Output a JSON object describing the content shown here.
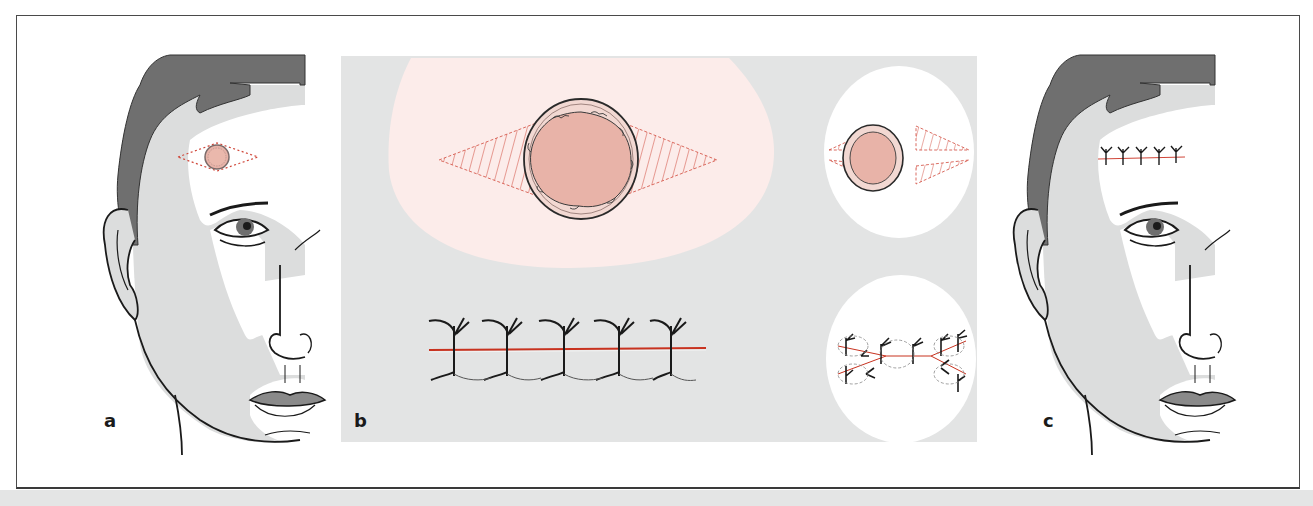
{
  "figure": {
    "panels": [
      {
        "id": "a",
        "label": "a",
        "description": "Face profile with circular lesion on forehead and dashed elliptical excision outline"
      },
      {
        "id": "b",
        "label": "b",
        "description": "Magnified views: elliptical excision around lesion with hatched wedges; sutured closure with interrupted sutures"
      },
      {
        "id": "c",
        "label": "c",
        "description": "Face profile with sutured linear closure on forehead"
      }
    ],
    "colors": {
      "hair": "#6f6f6f",
      "skin_shade": "#dcdddd",
      "skin_light": "#ffffff",
      "outline": "#1a1a1a",
      "lesion_fill": "#e8b3a8",
      "lesion_rim": "#f2d8d2",
      "excision_line": "#d0473a",
      "panel_b_bg": "#e3e4e4",
      "pink_field": "#fcecea",
      "suture_line": "#c8321f",
      "lips": "#8a8a8a"
    },
    "panel_b": {
      "suture_count_main": 5,
      "suture_count_inset": 10
    }
  }
}
